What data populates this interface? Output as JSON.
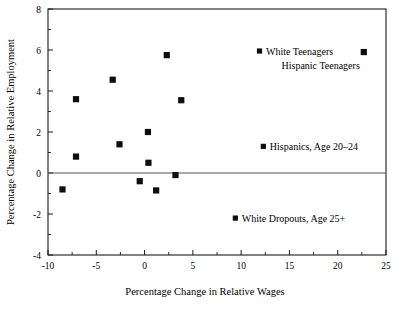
{
  "chart_data": {
    "type": "scatter",
    "title": "",
    "xlabel": "Percentage Change in Relative Wages",
    "ylabel": "Percentage Change in Relative Employment",
    "xlim": [
      -10,
      25
    ],
    "ylim": [
      -4,
      8
    ],
    "xticks": [
      -10,
      -5,
      0,
      5,
      10,
      15,
      20,
      25
    ],
    "xtick_labels": [
      "-10",
      "-5",
      "0",
      "5",
      "10",
      "15",
      "20",
      "25"
    ],
    "yticks": [
      -4,
      -2,
      0,
      2,
      4,
      6,
      8
    ],
    "ytick_labels": [
      "-4",
      "-2",
      "0",
      "2",
      "4",
      "6",
      "8"
    ],
    "x_minor_step": 2.5,
    "y_minor_step": 1,
    "grid": false,
    "zero_line": true,
    "legend_position": "inside-plot",
    "marker_shape": "square",
    "marker_color": "#0d0d0d",
    "series": [
      {
        "name": "Data points",
        "points": [
          {
            "x": -8.5,
            "y": -0.8
          },
          {
            "x": -7.1,
            "y": 3.6
          },
          {
            "x": -7.1,
            "y": 0.8
          },
          {
            "x": -3.3,
            "y": 4.55
          },
          {
            "x": -2.6,
            "y": 1.4
          },
          {
            "x": -0.5,
            "y": -0.4
          },
          {
            "x": 0.35,
            "y": 2.0
          },
          {
            "x": 0.4,
            "y": 0.5
          },
          {
            "x": 1.2,
            "y": -0.85
          },
          {
            "x": 2.3,
            "y": 5.75
          },
          {
            "x": 3.2,
            "y": -0.1
          },
          {
            "x": 3.8,
            "y": 3.55
          },
          {
            "x": 22.7,
            "y": 5.9
          }
        ]
      }
    ],
    "annotations": [
      {
        "label": "White Teenagers",
        "marker_x": 11.9,
        "marker_y": 5.95,
        "has_marker": true
      },
      {
        "label": "Hispanic Teenagers",
        "marker_x": 22.7,
        "marker_y": 5.9,
        "has_marker": false
      },
      {
        "label": "Hispanics, Age 20–24",
        "marker_x": 12.3,
        "marker_y": 1.3,
        "has_marker": true
      },
      {
        "label": "White Dropouts, Age 25+",
        "marker_x": 9.4,
        "marker_y": -2.2,
        "has_marker": true
      }
    ]
  }
}
